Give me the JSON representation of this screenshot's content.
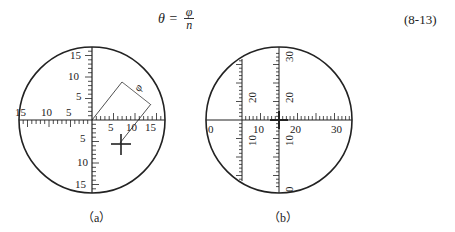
{
  "equation": {
    "lhs": "θ =",
    "numerator": "φ",
    "denominator": "n",
    "number": "(8-13)"
  },
  "figure_a": {
    "caption": "（a）",
    "h_left_labels": [
      "15",
      "10",
      "5"
    ],
    "h_right_labels": [
      "5",
      "10",
      "15"
    ],
    "v_up_labels": [
      "5",
      "10",
      "15"
    ],
    "v_down_labels": [
      "5",
      "10",
      "15"
    ],
    "angle_symbol": "φ"
  },
  "figure_b": {
    "caption": "（b）",
    "h_labels": [
      "0",
      "10",
      "20",
      "30"
    ],
    "v_left_labels": [
      "10",
      "20"
    ],
    "v_center_labels": [
      "0",
      "10",
      "20",
      "30"
    ]
  }
}
